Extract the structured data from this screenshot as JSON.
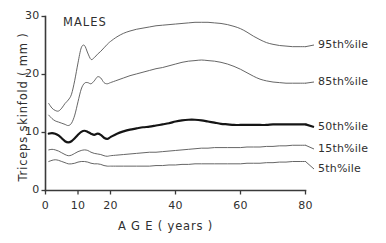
{
  "chart_data": {
    "type": "line",
    "title": "MALES",
    "xlabel": "A G E ( years )",
    "ylabel": "Triceps  skinfold  ( mm )",
    "xlim": [
      0,
      80
    ],
    "ylim": [
      0,
      30
    ],
    "xticks": [
      0,
      10,
      20,
      40,
      60,
      80
    ],
    "xticklabels": [
      "0",
      "10",
      "20",
      "40",
      "60",
      "80"
    ],
    "yticks": [
      0,
      10,
      20,
      30
    ],
    "yticklabels": [
      "0",
      "10",
      "20",
      "30"
    ],
    "grid": false,
    "legend_position": "right-inline-labels",
    "x": [
      1,
      2,
      3,
      4,
      5,
      6,
      7,
      8,
      9,
      10,
      11,
      12,
      13,
      14,
      15,
      16,
      17,
      18,
      19,
      20,
      22,
      24,
      26,
      28,
      30,
      32,
      34,
      36,
      38,
      40,
      42,
      44,
      46,
      48,
      50,
      52,
      54,
      56,
      58,
      60,
      62,
      64,
      66,
      68,
      70,
      72,
      74,
      76,
      78,
      80
    ],
    "series": [
      {
        "name": "95th%ile",
        "emphasis": false,
        "values": [
          15.0,
          14.2,
          13.8,
          13.7,
          14.2,
          15.0,
          15.6,
          16.6,
          19.0,
          22.0,
          24.6,
          25.0,
          23.7,
          22.6,
          22.9,
          23.5,
          24.0,
          24.6,
          25.2,
          25.7,
          26.5,
          27.1,
          27.5,
          27.8,
          28.0,
          28.2,
          28.4,
          28.5,
          28.6,
          28.7,
          28.8,
          28.9,
          29.0,
          29.0,
          29.0,
          28.9,
          28.8,
          28.6,
          28.3,
          27.9,
          27.3,
          26.6,
          26.0,
          25.5,
          25.2,
          25.0,
          24.9,
          24.8,
          24.8,
          24.8
        ]
      },
      {
        "name": "85th%ile",
        "emphasis": false,
        "values": [
          13.0,
          12.4,
          12.0,
          11.8,
          11.6,
          11.4,
          11.2,
          11.6,
          13.0,
          15.3,
          17.5,
          18.5,
          18.6,
          18.4,
          18.9,
          19.6,
          19.4,
          18.6,
          18.4,
          18.6,
          19.0,
          19.4,
          19.8,
          20.1,
          20.4,
          20.7,
          21.0,
          21.2,
          21.5,
          21.8,
          22.1,
          22.3,
          22.4,
          22.5,
          22.4,
          22.3,
          22.1,
          21.8,
          21.4,
          20.9,
          20.3,
          19.7,
          19.2,
          18.9,
          18.7,
          18.6,
          18.5,
          18.5,
          18.5,
          18.5
        ]
      },
      {
        "name": "50th%ile",
        "emphasis": true,
        "values": [
          9.8,
          9.9,
          9.8,
          9.5,
          9.0,
          8.5,
          8.3,
          8.5,
          9.0,
          9.6,
          10.1,
          10.3,
          10.1,
          9.8,
          9.6,
          9.8,
          9.6,
          9.1,
          8.9,
          9.2,
          9.8,
          10.2,
          10.5,
          10.7,
          10.9,
          11.0,
          11.2,
          11.4,
          11.6,
          11.9,
          12.1,
          12.2,
          12.2,
          12.1,
          11.9,
          11.7,
          11.5,
          11.4,
          11.3,
          11.3,
          11.3,
          11.3,
          11.3,
          11.3,
          11.4,
          11.4,
          11.4,
          11.4,
          11.4,
          11.4
        ]
      },
      {
        "name": "15th%ile",
        "emphasis": false,
        "values": [
          7.0,
          7.1,
          7.0,
          6.8,
          6.5,
          6.2,
          6.0,
          6.1,
          6.4,
          6.7,
          6.9,
          7.0,
          6.9,
          6.6,
          6.4,
          6.3,
          6.2,
          6.0,
          5.9,
          6.0,
          6.1,
          6.2,
          6.3,
          6.4,
          6.5,
          6.6,
          6.6,
          6.7,
          6.8,
          6.9,
          7.0,
          7.1,
          7.2,
          7.3,
          7.3,
          7.4,
          7.4,
          7.4,
          7.4,
          7.4,
          7.5,
          7.5,
          7.5,
          7.6,
          7.6,
          7.7,
          7.7,
          7.8,
          7.8,
          7.8
        ]
      },
      {
        "name": "5th%ile",
        "emphasis": false,
        "values": [
          5.0,
          5.2,
          5.3,
          5.2,
          5.0,
          4.8,
          4.6,
          4.6,
          4.7,
          4.9,
          5.0,
          5.0,
          4.9,
          4.7,
          4.6,
          4.6,
          4.5,
          4.3,
          4.2,
          4.2,
          4.2,
          4.2,
          4.2,
          4.2,
          4.2,
          4.2,
          4.3,
          4.3,
          4.4,
          4.4,
          4.5,
          4.5,
          4.6,
          4.6,
          4.6,
          4.6,
          4.6,
          4.6,
          4.6,
          4.6,
          4.7,
          4.7,
          4.7,
          4.8,
          4.8,
          4.9,
          4.9,
          5.0,
          5.0,
          5.0
        ]
      }
    ],
    "series_labels": [
      {
        "text": "95th%ile",
        "left": 318,
        "top": 38
      },
      {
        "text": "85th%ile",
        "left": 318,
        "top": 75
      },
      {
        "text": "50th%ile",
        "left": 318,
        "top": 120
      },
      {
        "text": "15th%ile",
        "left": 318,
        "top": 142
      },
      {
        "text": "5th%ile",
        "left": 318,
        "top": 162
      }
    ]
  }
}
